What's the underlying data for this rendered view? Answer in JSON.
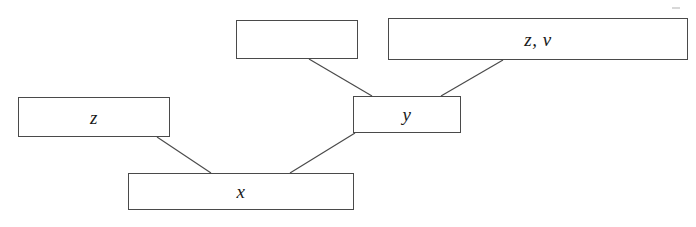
{
  "diagram": {
    "type": "node-link-diagram",
    "background_color": "#ffffff",
    "stroke_color": "#4a4a4a",
    "text_color": "#1a1a1a",
    "nodes": [
      {
        "id": "empty-top",
        "label": "",
        "x": 236,
        "y": 20,
        "width": 122,
        "height": 39
      },
      {
        "id": "zv",
        "label": "z, v",
        "x": 388,
        "y": 18,
        "width": 300,
        "height": 42
      },
      {
        "id": "y",
        "label": "y",
        "x": 353,
        "y": 96,
        "width": 108,
        "height": 37
      },
      {
        "id": "z",
        "label": "z",
        "x": 18,
        "y": 97,
        "width": 152,
        "height": 40
      },
      {
        "id": "x",
        "label": "x",
        "x": 128,
        "y": 173,
        "width": 226,
        "height": 37
      }
    ],
    "edges": [
      {
        "id": "edge-empty-top-to-y",
        "from": "empty-top",
        "to": "y",
        "x1": 309,
        "y1": 59,
        "x2": 372,
        "y2": 96
      },
      {
        "id": "edge-zv-to-y",
        "from": "zv",
        "to": "y",
        "x1": 503,
        "y1": 60,
        "x2": 441,
        "y2": 96
      },
      {
        "id": "edge-z-to-x",
        "from": "z",
        "to": "x",
        "x1": 157,
        "y1": 137,
        "x2": 211,
        "y2": 173
      },
      {
        "id": "edge-y-to-x",
        "from": "y",
        "to": "x",
        "x1": 355,
        "y1": 133,
        "x2": 290,
        "y2": 173
      }
    ],
    "artifacts": [
      {
        "id": "scan-speck-top-right",
        "x": 672,
        "y": 7,
        "width": 8,
        "height": 2
      }
    ]
  }
}
